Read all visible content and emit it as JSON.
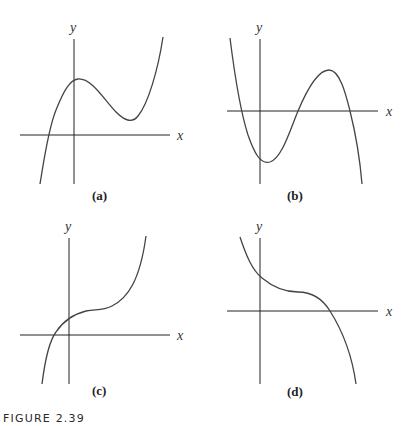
{
  "figure": {
    "caption": "FIGURE 2.39",
    "panels": [
      {
        "id": "a",
        "label": "(a)",
        "x_axis_label": "x",
        "y_axis_label": "y",
        "description": "Cubic with positive leading coefficient: one real root left of origin, local maximum near y-axis, local minimum above x-axis to the right"
      },
      {
        "id": "b",
        "label": "(b)",
        "x_axis_label": "x",
        "y_axis_label": "y",
        "description": "Cubic with negative leading coefficient: three real roots, local minimum below x-axis just right of origin, local maximum above x-axis"
      },
      {
        "id": "c",
        "label": "(c)",
        "x_axis_label": "x",
        "y_axis_label": "y",
        "description": "Increasing cubic with horizontal inflection point above x-axis right of origin, one root left of origin"
      },
      {
        "id": "d",
        "label": "(d)",
        "x_axis_label": "x",
        "y_axis_label": "y",
        "description": "Decreasing cubic with horizontal inflection point above x-axis, one positive root"
      }
    ]
  },
  "colors": {
    "axis": "#222222",
    "curve": "#444444",
    "background": "#ffffff"
  }
}
